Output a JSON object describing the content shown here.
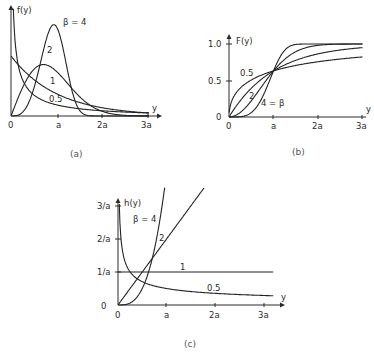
{
  "chart_data": [
    {
      "id": "a",
      "type": "line",
      "caption": "(a)",
      "ylabel": "f(y)",
      "xlabel": "y",
      "xticks": [
        "0",
        "a",
        "2a",
        "3a"
      ],
      "yticks": [],
      "function": "weibull_pdf",
      "scale": "a",
      "series": [
        {
          "name": "β = 4",
          "beta": 4,
          "label": "β = 4"
        },
        {
          "name": "2",
          "beta": 2,
          "label": "2"
        },
        {
          "name": "1",
          "beta": 1,
          "label": "1"
        },
        {
          "name": "0.5",
          "beta": 0.5,
          "label": "0.5"
        }
      ],
      "xlim": [
        0,
        3
      ],
      "ylim": [
        0,
        1.6
      ],
      "grid": false
    },
    {
      "id": "b",
      "type": "line",
      "caption": "(b)",
      "ylabel": "F(y)",
      "xlabel": "y",
      "xticks": [
        "0",
        "a",
        "2a",
        "3a"
      ],
      "yticks": [
        "0",
        "0.5",
        "1.0"
      ],
      "function": "weibull_cdf",
      "scale": "a",
      "series": [
        {
          "name": "0.5",
          "beta": 0.5,
          "label": "0.5"
        },
        {
          "name": "1",
          "beta": 1,
          "label": "1"
        },
        {
          "name": "2",
          "beta": 2,
          "label": "2"
        },
        {
          "name": "4 = β",
          "beta": 4,
          "label": "4 = β"
        }
      ],
      "xlim": [
        0,
        3
      ],
      "ylim": [
        0,
        1.0
      ],
      "grid": false
    },
    {
      "id": "c",
      "type": "line",
      "caption": "(c)",
      "ylabel": "h(y)",
      "xlabel": "y",
      "xticks": [
        "0",
        "a",
        "2a",
        "3a"
      ],
      "yticks": [
        "0",
        "1/a",
        "2/a",
        "3/a"
      ],
      "function": "weibull_hazard",
      "scale": "a",
      "series": [
        {
          "name": "β = 4",
          "beta": 4,
          "label": "β = 4"
        },
        {
          "name": "2",
          "beta": 2,
          "label": "2"
        },
        {
          "name": "1",
          "beta": 1,
          "label": "1"
        },
        {
          "name": "0.5",
          "beta": 0.5,
          "label": "0.5"
        }
      ],
      "xlim": [
        0,
        3.2
      ],
      "ylim": [
        0,
        3.3
      ],
      "grid": false
    }
  ]
}
